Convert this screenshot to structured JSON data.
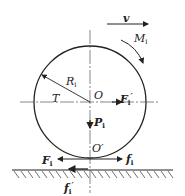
{
  "diagram": {
    "title": "",
    "labels": {
      "velocity": "v",
      "moment": "M",
      "moment_sub": "i",
      "radius": "R",
      "radius_sub": "i",
      "torque": "T",
      "center": "O",
      "inertia_force": "F",
      "inertia_force_sub": "i",
      "inertia_force_prime": "′",
      "weight": "P",
      "weight_sub": "i",
      "contact_point": "O′",
      "traction_force": "F",
      "traction_force_sub": "i",
      "friction": "f",
      "friction_sub": "i",
      "ground_reaction": "f",
      "ground_reaction_sub": "i",
      "ground_reaction_prime": "′"
    },
    "colors": {
      "stroke": "#222222",
      "centerline": "#555555",
      "background": "#ffffff"
    }
  }
}
